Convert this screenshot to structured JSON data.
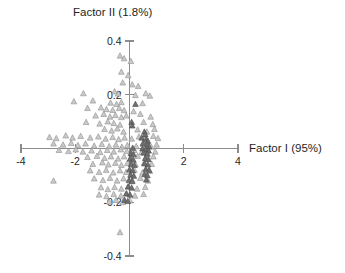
{
  "chart_data": {
    "type": "scatter",
    "title": "Factor II (1.8%)",
    "xlabel": "Factor I (95%)",
    "ylabel": "Factor II (1.8%)",
    "xlim": [
      -4,
      4
    ],
    "ylim": [
      -0.4,
      0.4
    ],
    "xticks": [
      -4,
      -2,
      2,
      4
    ],
    "yticks": [
      0.4,
      0.2,
      -0.2,
      -0.4
    ],
    "xtick_labels": [
      "-4",
      "-2",
      "2",
      "4"
    ],
    "ytick_labels": [
      "0.4",
      "0.2",
      "-0.2",
      "-0.4"
    ],
    "grid": false,
    "legend": false,
    "axes_style": "crossed-at-origin",
    "marker": "triangle",
    "colors": {
      "open_marker_fill": "#c9c9c9",
      "open_marker_stroke": "#8f8f8f",
      "dark_marker_fill": "#6f6f6f",
      "dark_marker_stroke": "#4a4a4a",
      "axis": "#8c8c8c",
      "text": "#1f1f1f",
      "background": "#ffffff"
    },
    "series": [
      {
        "name": "open-triangles",
        "style": "open",
        "points": [
          [
            -0.35,
            0.345
          ],
          [
            -0.2,
            0.335
          ],
          [
            0.05,
            0.325
          ],
          [
            -0.3,
            0.285
          ],
          [
            -0.05,
            0.272
          ],
          [
            -0.25,
            0.245
          ],
          [
            0.1,
            0.238
          ],
          [
            0.32,
            0.232
          ],
          [
            -1.7,
            0.205
          ],
          [
            -0.55,
            0.212
          ],
          [
            -0.42,
            0.204
          ],
          [
            0.22,
            0.198
          ],
          [
            0.6,
            0.205
          ],
          [
            0.75,
            0.196
          ],
          [
            -2.05,
            0.175
          ],
          [
            -1.35,
            0.178
          ],
          [
            -0.7,
            0.17
          ],
          [
            -0.48,
            0.165
          ],
          [
            -0.3,
            0.172
          ],
          [
            0.48,
            0.168
          ],
          [
            -1.55,
            0.15
          ],
          [
            -1.05,
            0.152
          ],
          [
            -0.85,
            0.146
          ],
          [
            -0.62,
            0.143
          ],
          [
            -0.38,
            0.15
          ],
          [
            -0.2,
            0.142
          ],
          [
            0.15,
            0.138
          ],
          [
            -1.25,
            0.122
          ],
          [
            -0.95,
            0.128
          ],
          [
            -0.72,
            0.118
          ],
          [
            -0.52,
            0.124
          ],
          [
            -0.3,
            0.116
          ],
          [
            -0.12,
            0.122
          ],
          [
            0.4,
            0.128
          ],
          [
            0.78,
            0.118
          ],
          [
            -1.6,
            0.098
          ],
          [
            -1.1,
            0.092
          ],
          [
            -0.8,
            0.1
          ],
          [
            -0.58,
            0.094
          ],
          [
            -0.35,
            0.088
          ],
          [
            0.52,
            0.098
          ],
          [
            0.86,
            0.09
          ],
          [
            -0.92,
            0.072
          ],
          [
            -0.66,
            0.066
          ],
          [
            -0.45,
            0.074
          ],
          [
            -0.22,
            0.062
          ],
          [
            0.3,
            0.07
          ],
          [
            0.64,
            0.062
          ],
          [
            0.92,
            0.072
          ],
          [
            -2.95,
            0.042
          ],
          [
            -2.7,
            0.038
          ],
          [
            -2.35,
            0.048
          ],
          [
            -2.1,
            0.04
          ],
          [
            -1.8,
            0.046
          ],
          [
            -1.45,
            0.04
          ],
          [
            -1.15,
            0.044
          ],
          [
            -0.88,
            0.036
          ],
          [
            -0.62,
            0.042
          ],
          [
            -0.4,
            0.034
          ],
          [
            -0.18,
            0.04
          ],
          [
            0.08,
            0.036
          ],
          [
            0.35,
            0.044
          ],
          [
            0.58,
            0.038
          ],
          [
            0.88,
            0.046
          ],
          [
            1.05,
            0.038
          ],
          [
            -2.8,
            0.018
          ],
          [
            -2.45,
            0.014
          ],
          [
            -2.15,
            0.02
          ],
          [
            -1.9,
            0.012
          ],
          [
            -1.62,
            0.018
          ],
          [
            -1.3,
            0.01
          ],
          [
            -1.02,
            0.016
          ],
          [
            -0.75,
            0.008
          ],
          [
            -0.5,
            0.014
          ],
          [
            -0.28,
            0.006
          ],
          [
            -0.08,
            0.012
          ],
          [
            0.25,
            0.008
          ],
          [
            0.5,
            0.016
          ],
          [
            0.8,
            0.006
          ],
          [
            1.0,
            0.014
          ],
          [
            -2.6,
            -0.006
          ],
          [
            -2.25,
            -0.01
          ],
          [
            -1.98,
            -0.004
          ],
          [
            -1.72,
            -0.012
          ],
          [
            -1.4,
            -0.008
          ],
          [
            -1.08,
            -0.014
          ],
          [
            -0.82,
            -0.006
          ],
          [
            -0.58,
            -0.012
          ],
          [
            -0.32,
            -0.004
          ],
          [
            -0.1,
            -0.01
          ],
          [
            0.18,
            -0.006
          ],
          [
            0.45,
            -0.014
          ],
          [
            0.7,
            -0.008
          ],
          [
            0.95,
            -0.012
          ],
          [
            -1.55,
            -0.032
          ],
          [
            -1.2,
            -0.028
          ],
          [
            -0.92,
            -0.036
          ],
          [
            -0.68,
            -0.03
          ],
          [
            -0.42,
            -0.038
          ],
          [
            -0.2,
            -0.03
          ],
          [
            0.05,
            -0.036
          ],
          [
            0.3,
            -0.028
          ],
          [
            0.62,
            -0.034
          ],
          [
            0.88,
            -0.03
          ],
          [
            -1.35,
            -0.058
          ],
          [
            -1.0,
            -0.052
          ],
          [
            -0.78,
            -0.06
          ],
          [
            -0.52,
            -0.054
          ],
          [
            -0.3,
            -0.062
          ],
          [
            -0.08,
            -0.055
          ],
          [
            0.22,
            -0.06
          ],
          [
            0.55,
            -0.052
          ],
          [
            0.82,
            -0.058
          ],
          [
            -1.45,
            -0.082
          ],
          [
            -1.12,
            -0.088
          ],
          [
            -0.86,
            -0.08
          ],
          [
            -0.6,
            -0.09
          ],
          [
            -0.35,
            -0.082
          ],
          [
            -0.12,
            -0.088
          ],
          [
            0.18,
            -0.08
          ],
          [
            0.48,
            -0.09
          ],
          [
            0.75,
            -0.084
          ],
          [
            -2.8,
            -0.12
          ],
          [
            -1.3,
            -0.112
          ],
          [
            -0.98,
            -0.118
          ],
          [
            -0.72,
            -0.11
          ],
          [
            -0.46,
            -0.12
          ],
          [
            -0.22,
            -0.112
          ],
          [
            0.1,
            -0.118
          ],
          [
            0.4,
            -0.11
          ],
          [
            0.68,
            -0.12
          ],
          [
            -1.05,
            -0.145
          ],
          [
            -0.8,
            -0.152
          ],
          [
            -0.55,
            -0.144
          ],
          [
            -0.3,
            -0.15
          ],
          [
            -0.05,
            -0.142
          ],
          [
            0.28,
            -0.15
          ],
          [
            0.58,
            -0.144
          ],
          [
            -1.12,
            -0.172
          ],
          [
            -0.85,
            -0.178
          ],
          [
            -0.58,
            -0.17
          ],
          [
            -0.32,
            -0.176
          ],
          [
            -0.1,
            -0.168
          ],
          [
            0.2,
            -0.176
          ],
          [
            0.52,
            -0.17
          ],
          [
            -0.75,
            -0.198
          ],
          [
            -0.5,
            -0.192
          ],
          [
            -0.25,
            -0.2
          ],
          [
            0.02,
            -0.194
          ],
          [
            -0.35,
            -0.312
          ]
        ]
      },
      {
        "name": "dark-triangles",
        "style": "dark",
        "points": [
          [
            0.22,
            0.165
          ],
          [
            0.08,
            0.098
          ],
          [
            0.1,
            0.085
          ],
          [
            0.55,
            0.062
          ],
          [
            0.58,
            0.052
          ],
          [
            0.45,
            0.04
          ],
          [
            0.62,
            0.034
          ],
          [
            0.68,
            0.028
          ],
          [
            0.5,
            0.02
          ],
          [
            0.65,
            0.014
          ],
          [
            0.72,
            0.008
          ],
          [
            0.12,
            0.002
          ],
          [
            0.48,
            0.0
          ],
          [
            0.6,
            -0.004
          ],
          [
            0.7,
            -0.008
          ],
          [
            0.05,
            -0.018
          ],
          [
            0.15,
            -0.022
          ],
          [
            0.52,
            -0.016
          ],
          [
            0.66,
            -0.02
          ],
          [
            0.02,
            -0.038
          ],
          [
            0.14,
            -0.042
          ],
          [
            0.58,
            -0.036
          ],
          [
            0.7,
            -0.04
          ],
          [
            0.06,
            -0.058
          ],
          [
            0.18,
            -0.062
          ],
          [
            0.55,
            -0.056
          ],
          [
            0.68,
            -0.06
          ],
          [
            0.0,
            -0.078
          ],
          [
            0.12,
            -0.082
          ],
          [
            0.6,
            -0.076
          ],
          [
            0.72,
            -0.08
          ],
          [
            0.04,
            -0.098
          ],
          [
            0.16,
            -0.102
          ],
          [
            0.56,
            -0.096
          ],
          [
            0.66,
            -0.1
          ],
          [
            -0.02,
            -0.118
          ],
          [
            0.1,
            -0.122
          ],
          [
            0.62,
            -0.116
          ],
          [
            -0.05,
            -0.142
          ],
          [
            0.08,
            -0.146
          ],
          [
            -0.12,
            -0.168
          ],
          [
            0.02,
            -0.172
          ],
          [
            -0.18,
            -0.192
          ],
          [
            -0.06,
            -0.196
          ]
        ]
      }
    ]
  }
}
